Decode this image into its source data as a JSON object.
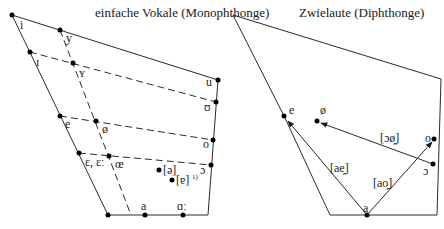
{
  "left_diagram": {
    "title": "einfache Vokale (Monophthonge)",
    "vowels": {
      "i": "i",
      "y": "y",
      "I": "ɪ",
      "Y": "ʏ",
      "u": "u",
      "U": "ʊ",
      "e": "e",
      "oe_close": "ø",
      "o": "o",
      "eps": "ɛ, ɛː",
      "oe_open": "œ",
      "open_o": "ɔ",
      "schwa": "[ə]",
      "turned_a": "[ɐ]",
      "footnote": "1)",
      "a": "a",
      "a_long": "ɑː"
    }
  },
  "right_diagram": {
    "title": "Zwielaute (Diphthonge)",
    "vowels": {
      "e": "e",
      "oe": "ø",
      "o": "o",
      "open_o": "ɔ",
      "a": "a"
    },
    "diphthongs": {
      "ae": "[ae̯]",
      "ao": "[ao̯]",
      "oy": "[ɔø̯]"
    }
  }
}
